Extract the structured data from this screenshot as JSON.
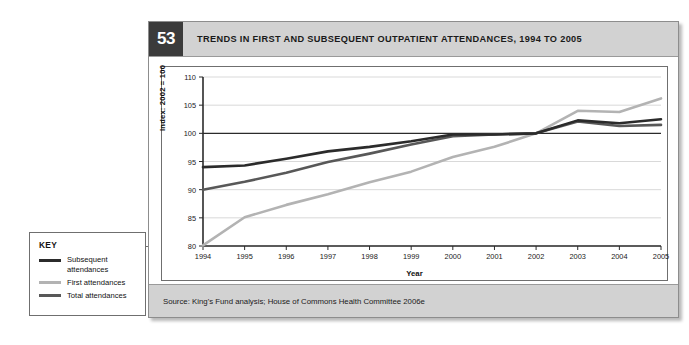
{
  "figure": {
    "number": "53",
    "title": "TRENDS IN FIRST AND SUBSEQUENT OUTPATIENT ATTENDANCES, 1994 TO 2005",
    "source": "Source: King's Fund analysis; House of Commons Health Committee 2006e"
  },
  "key": {
    "title": "KEY",
    "items": [
      {
        "label": "Subsequent attendances",
        "color": "#2b2b2b"
      },
      {
        "label": "First attendances",
        "color": "#b3b3b3"
      },
      {
        "label": "Total attendances",
        "color": "#585858"
      }
    ]
  },
  "chart_data": {
    "type": "line",
    "title": "TRENDS IN FIRST AND SUBSEQUENT OUTPATIENT ATTENDANCES, 1994 TO 2005",
    "xlabel": "Year",
    "ylabel": "Index: 2002 = 100",
    "categories": [
      "1994",
      "1995",
      "1996",
      "1997",
      "1998",
      "1999",
      "2000",
      "2001",
      "2002",
      "2003",
      "2004",
      "2005"
    ],
    "x": [
      1994,
      1995,
      1996,
      1997,
      1998,
      1999,
      2000,
      2001,
      2002,
      2003,
      2004,
      2005
    ],
    "xlim": [
      1994,
      2005
    ],
    "ylim": [
      80,
      110
    ],
    "yticks": [
      80,
      85,
      90,
      95,
      100,
      105,
      110
    ],
    "xticks": [
      "1994",
      "1995",
      "1996",
      "1997",
      "1998",
      "1999",
      "2000",
      "2001",
      "2002",
      "2003",
      "2004",
      "2005"
    ],
    "grid": true,
    "grid_axis": "y",
    "legend_position": "external-left",
    "reference_line": {
      "value": 100,
      "color": "#2b2b2b",
      "label": "Index = 100"
    },
    "series": [
      {
        "name": "Subsequent attendances",
        "color": "#2b2b2b",
        "values": [
          94.0,
          94.3,
          95.5,
          96.8,
          97.6,
          98.6,
          99.8,
          99.8,
          100.0,
          102.3,
          101.8,
          102.5
        ]
      },
      {
        "name": "First attendances",
        "color": "#b3b3b3",
        "values": [
          80.1,
          85.1,
          87.3,
          89.2,
          91.3,
          93.2,
          95.8,
          97.6,
          100.0,
          104.0,
          103.8,
          106.2
        ]
      },
      {
        "name": "Total attendances",
        "color": "#585858",
        "values": [
          90.0,
          91.4,
          93.0,
          94.9,
          96.4,
          98.0,
          99.5,
          99.8,
          100.0,
          102.1,
          101.3,
          101.5
        ]
      }
    ]
  }
}
